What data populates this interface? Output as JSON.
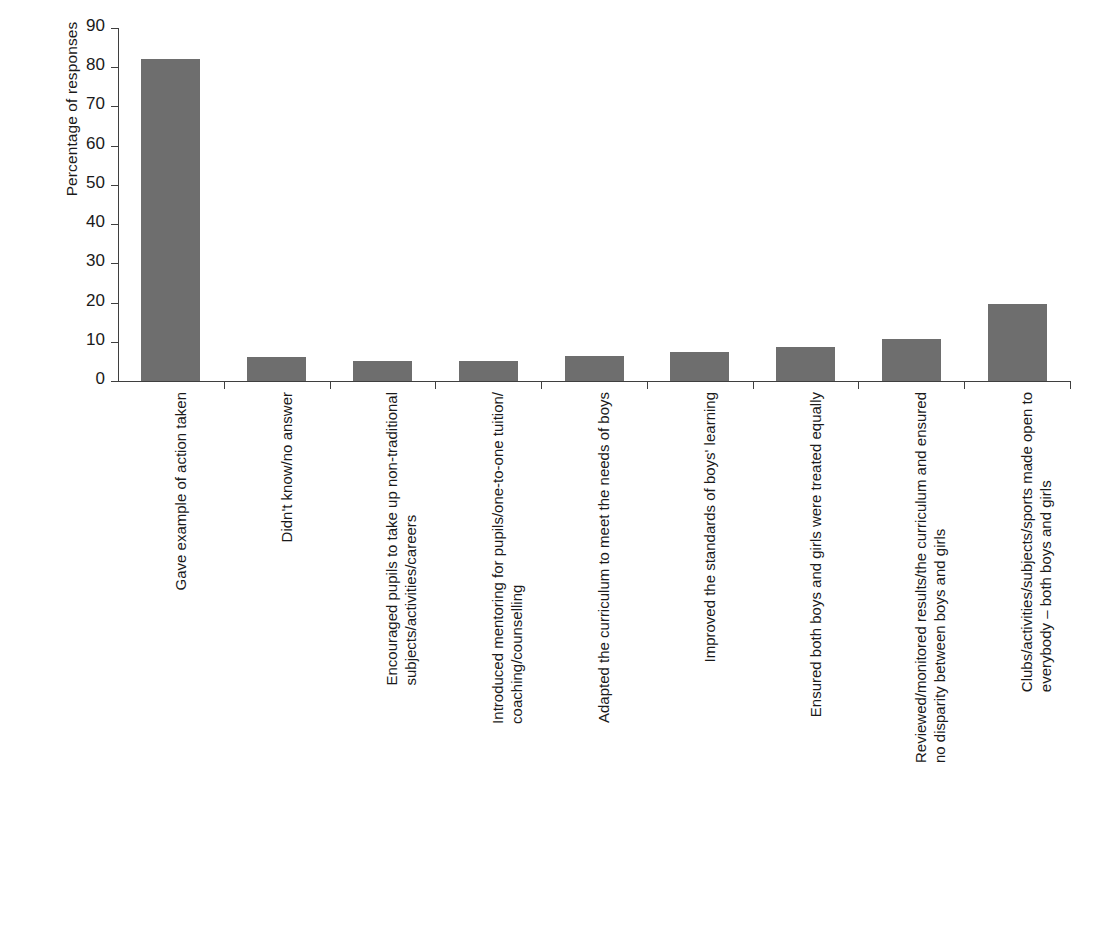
{
  "chart_data": {
    "type": "bar",
    "title": "",
    "subtitle": "",
    "xlabel": "",
    "ylabel": "Percentage of responses",
    "ylim": [
      0,
      90
    ],
    "yticks": [
      0,
      10,
      20,
      30,
      40,
      50,
      60,
      70,
      80,
      90
    ],
    "ytick_labels": [
      "0",
      "10",
      "20",
      "30",
      "40",
      "50",
      "60",
      "70",
      "80",
      "90"
    ],
    "grid": false,
    "legend": null,
    "bar_color": "#6e6e6e",
    "axis_color": "#3f3f3f",
    "categories": [
      "Gave example of action taken",
      "Didn't know/no answer",
      "Encouraged pupils to take up non-traditional subjects/activities/careers",
      "Introduced mentoring for pupils/one-to-one tuition/ coaching/counselling",
      "Adapted the curriculum to meet the needs of boys",
      "Improved the standards of boys' learning",
      "Ensured both boys and girls were treated equally",
      "Reviewed/monitored results/the curriculum and ensured no disparity between boys and girls",
      "Clubs/activities/subjects/sports made open to everybody – both boys and girls"
    ],
    "category_lines": [
      [
        "Gave example of action taken"
      ],
      [
        "Didn't know/no answer"
      ],
      [
        "Encouraged pupils to take up non-traditional",
        "subjects/activities/careers"
      ],
      [
        "Introduced mentoring for pupils/one-to-one tuition/",
        "coaching/counselling"
      ],
      [
        "Adapted the curriculum to meet the needs of boys"
      ],
      [
        "Improved the standards of boys' learning"
      ],
      [
        "Ensured both boys and girls were treated equally"
      ],
      [
        "Reviewed/monitored results/the curriculum and ensured",
        "no disparity between boys and girls"
      ],
      [
        "Clubs/activities/subjects/sports made open to",
        "everybody – both boys and girls"
      ]
    ],
    "values": [
      82,
      6,
      5.2,
      5.2,
      6.4,
      7.4,
      8.6,
      10.8,
      19.7
    ]
  }
}
